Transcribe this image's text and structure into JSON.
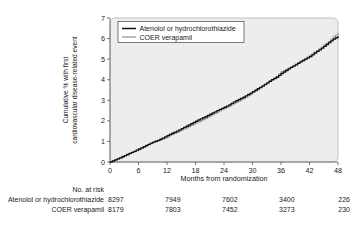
{
  "chart_data": {
    "type": "line",
    "title": "",
    "xlabel": "Months from randomization",
    "ylabel_line1": "Cumulative % with first",
    "ylabel_line2": "cardiovascular disease-related event",
    "xlim": [
      0,
      48
    ],
    "ylim": [
      0,
      7
    ],
    "xticks": [
      0,
      6,
      12,
      18,
      24,
      30,
      36,
      42,
      48
    ],
    "yticks": [
      0,
      1,
      2,
      3,
      4,
      5,
      6,
      7
    ],
    "xtick_labels": [
      "0",
      "6",
      "12",
      "18",
      "24",
      "30",
      "36",
      "42",
      "48"
    ],
    "ytick_labels": [
      "0",
      "1",
      "2",
      "3",
      "4",
      "5",
      "6",
      "7"
    ],
    "grid": false,
    "legend_position": "upper-left-inside",
    "series": [
      {
        "name": "Atenolol or hydrochlorothiazide",
        "color": "#101010",
        "x": [
          0,
          1,
          2,
          3,
          4,
          5,
          6,
          7,
          8,
          9,
          10,
          11,
          12,
          13,
          14,
          15,
          16,
          17,
          18,
          19,
          20,
          21,
          22,
          23,
          24,
          25,
          26,
          27,
          28,
          29,
          30,
          31,
          32,
          33,
          34,
          35,
          36,
          37,
          38,
          39,
          40,
          41,
          42,
          43,
          44,
          45,
          46,
          47,
          48
        ],
        "values": [
          0.0,
          0.1,
          0.2,
          0.31,
          0.42,
          0.52,
          0.63,
          0.74,
          0.86,
          0.97,
          1.05,
          1.16,
          1.28,
          1.4,
          1.5,
          1.62,
          1.74,
          1.86,
          1.98,
          2.1,
          2.2,
          2.32,
          2.44,
          2.56,
          2.66,
          2.78,
          2.92,
          3.04,
          3.15,
          3.28,
          3.42,
          3.56,
          3.7,
          3.85,
          4.0,
          4.12,
          4.3,
          4.45,
          4.6,
          4.72,
          4.87,
          5.0,
          5.12,
          5.3,
          5.45,
          5.62,
          5.8,
          5.98,
          6.1
        ]
      },
      {
        "name": "COER verapamil",
        "color": "#9a9a9a",
        "x": [
          0,
          1,
          2,
          3,
          4,
          5,
          6,
          7,
          8,
          9,
          10,
          11,
          12,
          13,
          14,
          15,
          16,
          17,
          18,
          19,
          20,
          21,
          22,
          23,
          24,
          25,
          26,
          27,
          28,
          29,
          30,
          31,
          32,
          33,
          34,
          35,
          36,
          37,
          38,
          39,
          40,
          41,
          42,
          43,
          44,
          45,
          46,
          47,
          48
        ],
        "values": [
          0.0,
          0.1,
          0.2,
          0.3,
          0.4,
          0.5,
          0.6,
          0.72,
          0.84,
          0.95,
          1.02,
          1.12,
          1.22,
          1.34,
          1.44,
          1.55,
          1.66,
          1.78,
          1.9,
          2.0,
          2.12,
          2.24,
          2.36,
          2.48,
          2.6,
          2.72,
          2.84,
          2.96,
          3.08,
          3.22,
          3.38,
          3.52,
          3.68,
          3.84,
          4.0,
          4.16,
          4.38,
          4.5,
          4.62,
          4.76,
          4.9,
          5.02,
          5.18,
          5.34,
          5.5,
          5.68,
          5.86,
          6.1,
          6.25
        ]
      }
    ]
  },
  "legend": {
    "items": [
      {
        "label": "Atenolol or hydrochlorothiazide",
        "color": "#101010"
      },
      {
        "label": "COER verapamil",
        "color": "#9a9a9a"
      }
    ]
  },
  "risk_table": {
    "heading": "No. at risk",
    "columns_x": [
      0,
      12,
      24,
      36,
      48
    ],
    "rows": [
      {
        "label": "Atenolol or hydrochlorothiazide",
        "values": [
          "8297",
          "7949",
          "7602",
          "3400",
          "226"
        ]
      },
      {
        "label": "COER verapamil",
        "values": [
          "8179",
          "7803",
          "7452",
          "3273",
          "230"
        ]
      }
    ]
  }
}
